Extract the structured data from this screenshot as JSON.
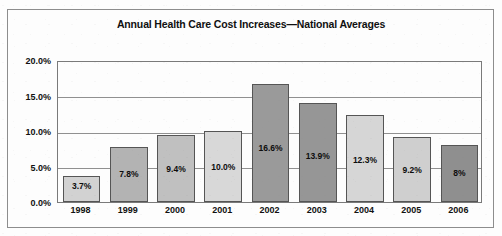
{
  "chart_data": {
    "type": "bar",
    "title": "Annual Health Care Cost Increases—National Averages",
    "xlabel": "",
    "ylabel": "",
    "categories": [
      "1998",
      "1999",
      "2000",
      "2001",
      "2002",
      "2003",
      "2004",
      "2005",
      "2006"
    ],
    "values": [
      3.7,
      7.8,
      9.4,
      10.0,
      16.6,
      13.9,
      12.3,
      9.2,
      8.0
    ],
    "data_labels": [
      "3.7%",
      "7.8%",
      "9.4%",
      "10.0%",
      "16.6%",
      "13.9%",
      "12.3%",
      "9.2%",
      "8%"
    ],
    "ylim": [
      0,
      20
    ],
    "yticks": [
      0,
      5,
      10,
      15,
      20
    ],
    "ytick_labels": [
      "0.0%",
      "5.0%",
      "10.0%",
      "15.0%",
      "20.0%"
    ],
    "grid": true,
    "legend": "none",
    "bar_colors": [
      "#d2d2d2",
      "#b3b3b3",
      "#c0c0c0",
      "#d8d8d8",
      "#9a9a9a",
      "#969696",
      "#d6d6d6",
      "#cfcfcf",
      "#8f8f8f"
    ],
    "bar_edge_color": "#555555",
    "grid_color": "#909090",
    "plot_border_color": "#7a7a7a",
    "frame_color": "#8d8d8d",
    "background_color": "#fdfdfd",
    "text_color": "#111111"
  }
}
